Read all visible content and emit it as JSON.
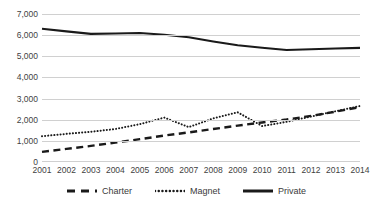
{
  "chart_data": {
    "type": "line",
    "title": "",
    "subtitle": "",
    "xlabel": "",
    "ylabel": "",
    "grid": true,
    "legend_position": "bottom",
    "ylim": [
      0,
      7000
    ],
    "ytick_labels": [
      "7,000",
      "6,000",
      "5,000",
      "4,000",
      "3,000",
      "2,000",
      "1,000",
      "0"
    ],
    "ytick_values": [
      7000,
      6000,
      5000,
      4000,
      3000,
      2000,
      1000,
      0
    ],
    "categories": [
      "2001",
      "2002",
      "2003",
      "2004",
      "2005",
      "2006",
      "2007",
      "2008",
      "2009",
      "2010",
      "2011",
      "2012",
      "2013",
      "2014"
    ],
    "x": [
      2001,
      2002,
      2003,
      2004,
      2005,
      2006,
      2007,
      2008,
      2009,
      2010,
      2011,
      2012,
      2013,
      2014
    ],
    "series": [
      {
        "name": "Charter",
        "style": "dashed",
        "color": "#1a1a1a",
        "values": [
          480,
          620,
          760,
          920,
          1080,
          1250,
          1400,
          1560,
          1720,
          1870,
          2010,
          2180,
          2380,
          2600
        ]
      },
      {
        "name": "Magnet",
        "style": "dotted",
        "color": "#1a1a1a",
        "values": [
          1220,
          1330,
          1430,
          1560,
          1790,
          2100,
          1650,
          2060,
          2350,
          1700,
          1900,
          2150,
          2400,
          2650
        ]
      },
      {
        "name": "Private",
        "style": "solid",
        "color": "#1a1a1a",
        "values": [
          6300,
          6180,
          6060,
          6080,
          6100,
          6020,
          5900,
          5700,
          5520,
          5400,
          5300,
          5330,
          5370,
          5400
        ]
      }
    ]
  },
  "legend": {
    "entries": [
      {
        "label": "Charter",
        "marker": "dashed-line-swatch"
      },
      {
        "label": "Magnet",
        "marker": "dotted-line-swatch"
      },
      {
        "label": "Private",
        "marker": "solid-line-swatch"
      }
    ]
  }
}
